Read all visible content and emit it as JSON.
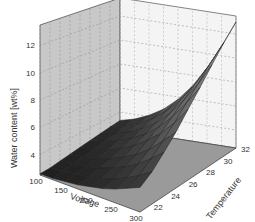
{
  "chart_data": {
    "type": "surface3d",
    "title": "",
    "xlabel": "Voltage",
    "ylabel": "Temperature",
    "zlabel": "Water content [wt%]",
    "x_ticks": [
      100,
      150,
      200,
      250,
      300
    ],
    "y_ticks": [
      22,
      24,
      26,
      28,
      30,
      32
    ],
    "z_ticks": [
      4,
      6,
      8,
      10,
      12
    ],
    "xlim": [
      100,
      300
    ],
    "ylim": [
      21,
      32
    ],
    "zlim": [
      2.5,
      13.5
    ],
    "grid": true,
    "x": [
      100,
      125,
      150,
      175,
      200,
      225,
      250,
      275,
      300
    ],
    "y": [
      21,
      22.375,
      23.75,
      25.125,
      26.5,
      27.875,
      29.25,
      30.625,
      32
    ],
    "z": [
      [
        2.6,
        2.6,
        2.7,
        2.8,
        3.0,
        3.2,
        3.5,
        3.9,
        4.3
      ],
      [
        2.6,
        2.7,
        2.8,
        2.9,
        3.1,
        3.4,
        3.8,
        4.3,
        4.9
      ],
      [
        2.7,
        2.8,
        2.9,
        3.1,
        3.4,
        3.8,
        4.3,
        5.0,
        5.8
      ],
      [
        2.8,
        2.9,
        3.1,
        3.3,
        3.7,
        4.2,
        4.9,
        5.8,
        6.8
      ],
      [
        2.9,
        3.0,
        3.2,
        3.6,
        4.1,
        4.8,
        5.6,
        6.7,
        8.0
      ],
      [
        3.0,
        3.2,
        3.5,
        3.9,
        4.5,
        5.3,
        6.4,
        7.7,
        9.2
      ],
      [
        3.1,
        3.3,
        3.7,
        4.2,
        4.9,
        5.9,
        7.2,
        8.7,
        10.5
      ],
      [
        3.2,
        3.5,
        3.9,
        4.5,
        5.4,
        6.5,
        8.0,
        9.8,
        11.8
      ],
      [
        3.3,
        3.6,
        4.1,
        4.8,
        5.8,
        7.1,
        8.8,
        10.8,
        13.0
      ]
    ]
  },
  "labels": {
    "x_axis": "Voltage",
    "y_axis": "Temperature",
    "z_axis": "Water content [wt%]"
  }
}
